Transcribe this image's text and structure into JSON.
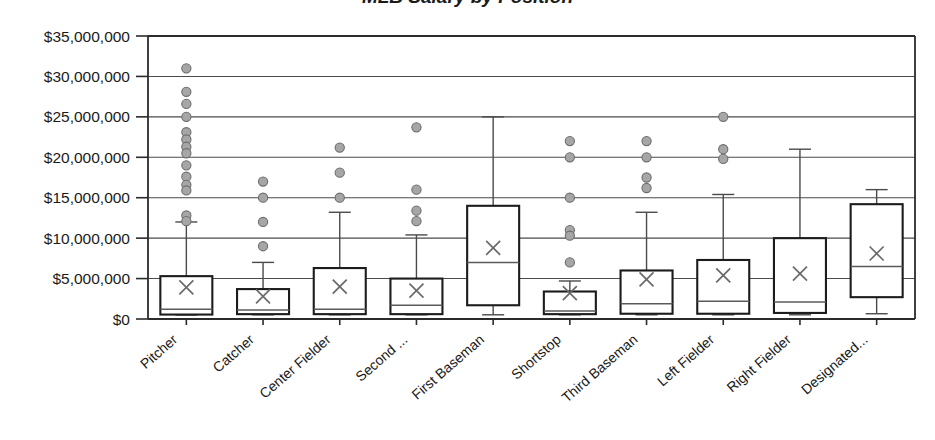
{
  "chart_data": {
    "type": "box",
    "title": "MLB Salary by Position",
    "xlabel": "",
    "ylabel": "",
    "ylim": [
      0,
      35000000
    ],
    "ytick_values": [
      0,
      5000000,
      10000000,
      15000000,
      20000000,
      25000000,
      30000000,
      35000000
    ],
    "ytick_labels": [
      "$0",
      "$5,000,000",
      "$10,000,000",
      "$15,000,000",
      "$20,000,000",
      "$25,000,000",
      "$30,000,000",
      "$35,000,000"
    ],
    "grid": true,
    "legend": "none",
    "categories": [
      "Pitcher",
      "Catcher",
      "Center Fielder",
      "Second ...",
      "First Baseman",
      "Shortstop",
      "Third Baseman",
      "Left Fielder",
      "Right Fielder",
      "Designated..."
    ],
    "boxes": [
      {
        "label": "Pitcher",
        "whisker_low": 500000,
        "q1": 550000,
        "median": 1200000,
        "q3": 5300000,
        "whisker_high": 12000000,
        "mean": 3900000,
        "outliers": [
          31000000,
          28100000,
          26600000,
          25000000,
          23100000,
          22200000,
          21300000,
          20500000,
          19000000,
          17600000,
          16600000,
          15900000,
          12800000,
          12100000
        ]
      },
      {
        "label": "Catcher",
        "whisker_low": 520000,
        "q1": 600000,
        "median": 1100000,
        "q3": 3700000,
        "whisker_high": 7000000,
        "mean": 2800000,
        "outliers": [
          17000000,
          15000000,
          12000000,
          9000000
        ]
      },
      {
        "label": "Center Fielder",
        "whisker_low": 520000,
        "q1": 600000,
        "median": 1200000,
        "q3": 6300000,
        "whisker_high": 13200000,
        "mean": 4000000,
        "outliers": [
          21200000,
          18100000,
          15000000
        ]
      },
      {
        "label": "Second ...",
        "whisker_low": 520000,
        "q1": 600000,
        "median": 1700000,
        "q3": 5000000,
        "whisker_high": 10400000,
        "mean": 3500000,
        "outliers": [
          23700000,
          16000000,
          13400000,
          12100000
        ]
      },
      {
        "label": "First Baseman",
        "whisker_low": 520000,
        "q1": 1700000,
        "median": 7000000,
        "q3": 14000000,
        "whisker_high": 25000000,
        "mean": 8800000,
        "outliers": []
      },
      {
        "label": "Shortstop",
        "whisker_low": 520000,
        "q1": 600000,
        "median": 1000000,
        "q3": 3400000,
        "whisker_high": 4700000,
        "mean": 3200000,
        "outliers": [
          22000000,
          20000000,
          15000000,
          11000000,
          10300000,
          7000000
        ]
      },
      {
        "label": "Third Baseman",
        "whisker_low": 520000,
        "q1": 650000,
        "median": 1900000,
        "q3": 6000000,
        "whisker_high": 13200000,
        "mean": 4900000,
        "outliers": [
          22000000,
          20000000,
          17500000,
          16200000
        ]
      },
      {
        "label": "Left Fielder",
        "whisker_low": 520000,
        "q1": 650000,
        "median": 2200000,
        "q3": 7300000,
        "whisker_high": 15400000,
        "mean": 5400000,
        "outliers": [
          25000000,
          21000000,
          19800000
        ]
      },
      {
        "label": "Right Fielder",
        "whisker_low": 520000,
        "q1": 750000,
        "median": 2100000,
        "q3": 10000000,
        "whisker_high": 21000000,
        "mean": 5600000,
        "outliers": []
      },
      {
        "label": "Designated...",
        "whisker_low": 650000,
        "q1": 2700000,
        "median": 6500000,
        "q3": 14200000,
        "whisker_high": 16000000,
        "mean": 8100000,
        "outliers": []
      }
    ]
  },
  "colors": {
    "box_stroke": "#1c1c1c",
    "grid": "#4a4a4a",
    "outlier_fill": "#a6a6a6",
    "text": "#1a1a1a",
    "background": "#ffffff"
  }
}
